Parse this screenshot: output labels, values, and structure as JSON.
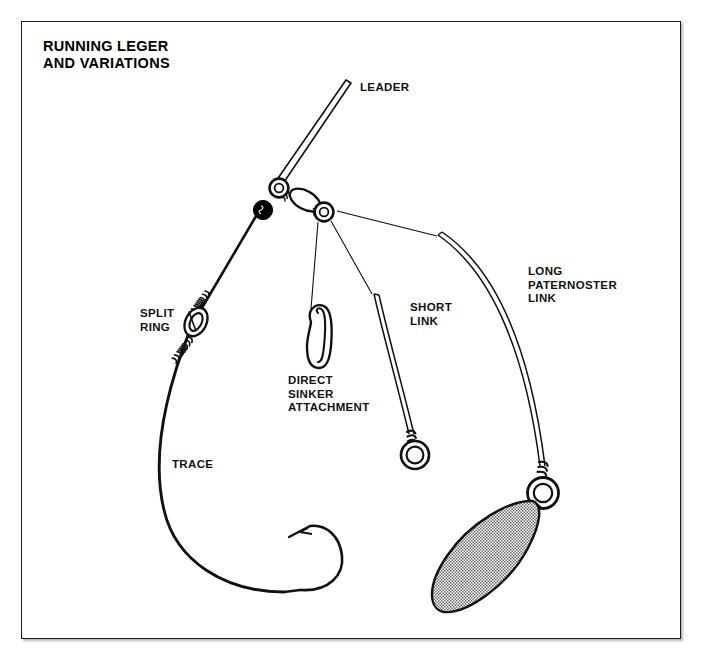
{
  "page": {
    "background_color": "#ffffff",
    "frame_color": "#1a1a1a"
  },
  "title": "RUNNING LEGER\nAND VARIATIONS",
  "labels": {
    "leader": "LEADER",
    "split_ring": "SPLIT\nRING",
    "direct_sinker": "DIRECT\nSINKER\nATTACHMENT",
    "short_link": "SHORT\nLINK",
    "long_paternoster": "LONG\nPATERNOSTER\nLINK",
    "trace": "TRACE"
  },
  "diagram": {
    "type": "technical-line-illustration",
    "line_color": "#111111",
    "sinker_fill": "#b9b9b9",
    "bead_color": "#000000",
    "components": [
      {
        "name": "leader",
        "style": "double-line",
        "from": [
          345,
          82
        ],
        "to": [
          276,
          186
        ]
      },
      {
        "name": "swivel-left-ring",
        "center": [
          278,
          188
        ],
        "radius": 9
      },
      {
        "name": "black-bead",
        "center": [
          263,
          211
        ],
        "radius": 9
      },
      {
        "name": "swivel-barrel",
        "center": [
          303,
          199
        ],
        "rx": 16,
        "ry": 9
      },
      {
        "name": "swivel-right-ring",
        "center": [
          323,
          211
        ],
        "radius": 9
      },
      {
        "name": "trace",
        "style": "thick-curve",
        "from": [
          258,
          218
        ],
        "to": [
          322,
          590
        ]
      },
      {
        "name": "split-ring",
        "center": [
          196,
          320
        ],
        "radius": 13
      },
      {
        "name": "whipping-above-split-ring",
        "at": [
          210,
          298
        ]
      },
      {
        "name": "whipping-below-split-ring",
        "at": [
          184,
          345
        ]
      },
      {
        "name": "hook",
        "bend_center": [
          313,
          552
        ],
        "point": [
          291,
          530
        ]
      },
      {
        "name": "direct-sinker-attachment",
        "style": "safety-pin-clip",
        "top": [
          318,
          312
        ],
        "bottom": [
          320,
          368
        ]
      },
      {
        "name": "short-link",
        "style": "double-line-curve",
        "from": [
          374,
          296
        ],
        "to": [
          414,
          441
        ]
      },
      {
        "name": "short-link-ring",
        "center": [
          415,
          454
        ],
        "radius": 14
      },
      {
        "name": "short-link-whipping",
        "at": [
          412,
          432
        ]
      },
      {
        "name": "long-paternoster-link",
        "style": "double-line-curve",
        "from": [
          440,
          235
        ],
        "to": [
          545,
          482
        ]
      },
      {
        "name": "long-link-ring",
        "center": [
          544,
          492
        ],
        "radius": 15
      },
      {
        "name": "long-link-whipping",
        "at": [
          551,
          470
        ]
      },
      {
        "name": "sinker",
        "style": "stippled-leaf",
        "tip_top": [
          530,
          500
        ],
        "tip_bottom": [
          440,
          612
        ]
      }
    ],
    "pointer_lines": [
      {
        "name": "pointer-to-direct-sinker",
        "from": [
          319,
          221
        ],
        "to": [
          311,
          308
        ]
      },
      {
        "name": "pointer-to-short-link",
        "from": [
          330,
          220
        ],
        "to": [
          372,
          294
        ]
      },
      {
        "name": "pointer-to-long-link",
        "from": [
          338,
          212
        ],
        "to": [
          437,
          236
        ]
      }
    ]
  }
}
